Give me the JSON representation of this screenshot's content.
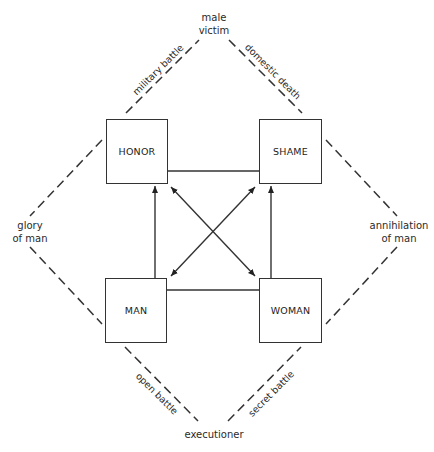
{
  "diagram": {
    "type": "semiotic-square",
    "boxes": {
      "top_left": "HONOR",
      "top_right": "SHAME",
      "bottom_left": "MAN",
      "bottom_right": "WOMAN"
    },
    "outer_nodes": {
      "top": [
        "male",
        "victim"
      ],
      "left": [
        "glory",
        "of man"
      ],
      "right": [
        "annihilation",
        "of man"
      ],
      "bottom": [
        "executioner"
      ]
    },
    "edge_labels": {
      "top_left": "military battle",
      "top_right": "domestic death",
      "bottom_left": "open battle",
      "bottom_right": "secret battle"
    },
    "relations": [
      {
        "from": "MAN",
        "to": "HONOR",
        "style": "arrow"
      },
      {
        "from": "WOMAN",
        "to": "SHAME",
        "style": "arrow"
      },
      {
        "from": "HONOR",
        "to": "WOMAN",
        "style": "double-arrow"
      },
      {
        "from": "SHAME",
        "to": "MAN",
        "style": "double-arrow"
      },
      {
        "from": "HONOR",
        "to": "SHAME",
        "style": "line"
      },
      {
        "from": "MAN",
        "to": "WOMAN",
        "style": "line"
      }
    ],
    "colors": {
      "line": "#333333",
      "background": "#ffffff"
    }
  }
}
